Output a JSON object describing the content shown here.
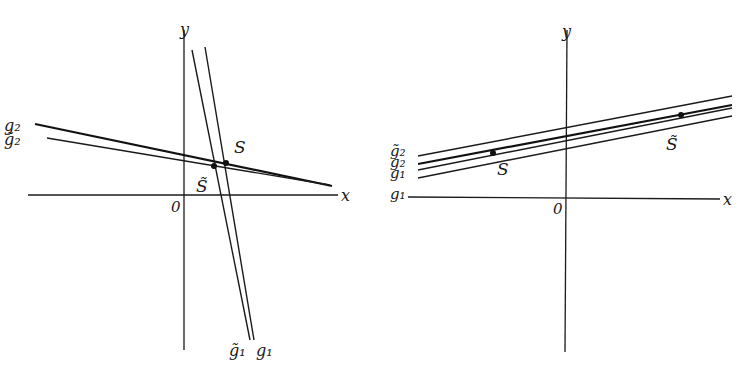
{
  "figure": {
    "panels": [
      {
        "id": "left",
        "axes": {
          "x_label": "x",
          "y_label": "y",
          "origin_label": "0",
          "origin": [
            184,
            195
          ],
          "x_axis": [
            [
              28,
              195
            ],
            [
              338,
              195
            ]
          ],
          "y_axis": [
            [
              184,
              30
            ],
            [
              184,
              350
            ]
          ]
        },
        "lines": [
          {
            "name": "g2",
            "label": "g₂",
            "from": [
              35,
              124
            ],
            "to": [
              332,
              186
            ],
            "weight": "thick"
          },
          {
            "name": "g2-tilde",
            "label": "g̃₂",
            "from": [
              47,
              138
            ],
            "to": [
              330,
              185
            ],
            "weight": "thin"
          },
          {
            "name": "g1-tilde",
            "label": "g̃₁",
            "from": [
              192,
              50
            ],
            "to": [
              250,
              340
            ],
            "weight": "thin"
          },
          {
            "name": "g1",
            "label": "g₁",
            "from": [
              205,
              47
            ],
            "to": [
              254,
              340
            ],
            "weight": "thin"
          }
        ],
        "points": [
          {
            "name": "S",
            "label": "S",
            "at": [
              226,
              163
            ],
            "label_at": [
              234,
              153
            ]
          },
          {
            "name": "S-tilde",
            "label": "S̃",
            "at": [
              214,
              166
            ],
            "label_at": [
              196,
              192
            ]
          }
        ],
        "line_labels": [
          {
            "text": "g₂",
            "at": [
              4,
              131
            ]
          },
          {
            "text": "g̃₂",
            "at": [
              4,
              145
            ]
          },
          {
            "text": "g̃₁",
            "at": [
              229,
              356
            ]
          },
          {
            "text": "g₁",
            "at": [
              256,
              356
            ]
          }
        ]
      },
      {
        "id": "right",
        "axes": {
          "x_label": "x",
          "y_label": "y",
          "origin_label": "0",
          "origin": [
            566,
            198
          ],
          "x_axis": [
            [
              408,
              198
            ],
            [
              720,
              198
            ]
          ],
          "y_axis": [
            [
              566,
              30
            ],
            [
              566,
              352
            ]
          ]
        },
        "lines": [
          {
            "name": "g2-tilde",
            "label": "g̃₂",
            "from": [
              418,
              156
            ],
            "to": [
              732,
              96
            ],
            "weight": "thin"
          },
          {
            "name": "g2",
            "label": "g₂",
            "from": [
              418,
              164
            ],
            "to": [
              732,
              105
            ],
            "weight": "thick"
          },
          {
            "name": "g1-tilde",
            "label": "g̃₁",
            "from": [
              418,
              170
            ],
            "to": [
              732,
              108
            ],
            "weight": "thin"
          },
          {
            "name": "g1",
            "label": "g₁",
            "from": [
              418,
              178
            ],
            "to": [
              732,
              116
            ],
            "weight": "thin"
          }
        ],
        "points": [
          {
            "name": "S",
            "label": "S",
            "at": [
              493,
              153
            ],
            "label_at": [
              497,
              175
            ]
          },
          {
            "name": "S-tilde",
            "label": "S̃",
            "at": [
              681,
              115
            ],
            "label_at": [
              666,
              150
            ]
          }
        ],
        "line_labels": [
          {
            "text": "g̃₂",
            "at": [
              390,
              156
            ]
          },
          {
            "text": "g₂",
            "at": [
              390,
              167
            ]
          },
          {
            "text": "g₁",
            "at": [
              390,
              178
            ]
          },
          {
            "text": "g₁",
            "at": [
              390,
              199
            ]
          }
        ]
      }
    ]
  }
}
